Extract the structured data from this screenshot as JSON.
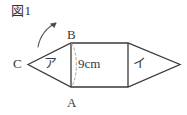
{
  "figure": {
    "caption": "図1",
    "vertices": [
      {
        "name": "B",
        "label": "B"
      },
      {
        "name": "A",
        "label": "A"
      },
      {
        "name": "C",
        "label": "C"
      }
    ],
    "regions": [
      {
        "name": "left-triangle",
        "label": "ア"
      },
      {
        "name": "right-triangle",
        "label": "イ"
      }
    ],
    "dimension": {
      "label": "9cm",
      "measures": "segment-AB"
    },
    "annotation": {
      "name": "leader-arrow",
      "description": "curved arrow pointing to vertex B"
    },
    "colors": {
      "background": "#ffffff",
      "stroke": "#3a3a3a",
      "text": "#333333",
      "dashed": "#9a9a9a"
    }
  }
}
